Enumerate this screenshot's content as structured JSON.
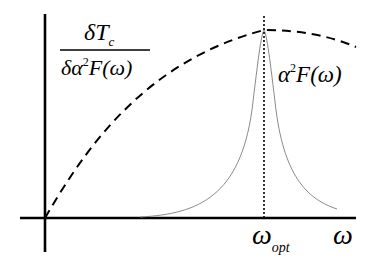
{
  "diagram": {
    "type": "schematic-plot",
    "axes": {
      "x_label": "ω",
      "y_label": ""
    },
    "curves": [
      {
        "name": "dTc_dalpha2F",
        "style": "dashed",
        "label_num": "δT",
        "label_num_sub": "c",
        "label_den": "δα",
        "label_den_sup": "2",
        "label_den_rest": "F(ω)"
      },
      {
        "name": "alpha2F",
        "style": "thin-solid",
        "label_main": "α",
        "label_sup": "2",
        "label_rest": "F(ω)"
      }
    ],
    "marker": {
      "style": "dotted-vertical",
      "label_main": "ω",
      "label_sub": "opt"
    },
    "colors": {
      "axis": "#000000",
      "dashed_curve": "#000000",
      "peak_curve": "#8a8a8a",
      "background": "#ffffff"
    }
  }
}
